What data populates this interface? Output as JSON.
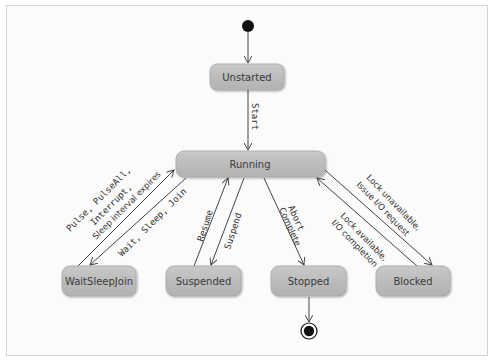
{
  "diagram": {
    "type": "UML state machine",
    "states": {
      "unstarted": "Unstarted",
      "running": "Running",
      "waitsleepjoin": "WaitSleepJoin",
      "suspended": "Suspended",
      "stopped": "Stopped",
      "blocked": "Blocked"
    },
    "transitions": {
      "start": "Start",
      "pulse_line1": "Pulse, PulseAll,",
      "pulse_line2": "Interrupt,",
      "pulse_line3": "Sleep interval expires",
      "wait_sleep_join": "Wait, Sleep, Join",
      "resume": "Resume",
      "suspend": "Suspend",
      "abort": "Abort",
      "complete": "Complete",
      "lock_available_line1": "Lock available,",
      "lock_available_line2": "I/O completion",
      "lock_unavailable_line1": "Lock unavailable,",
      "lock_unavailable_line2": "Issue I/O request"
    },
    "colors": {
      "state_fill": "#b8b8b8",
      "state_fill_light": "#cfcfcf",
      "state_border": "#a8a8a8",
      "line": "#444444",
      "frame_border": "#d4d4d4"
    }
  }
}
